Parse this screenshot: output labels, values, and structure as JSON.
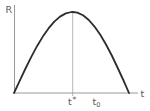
{
  "labels": {
    "y_axis": "R",
    "x_axis": "t",
    "peak_base": "t",
    "peak_sup": "*",
    "t0_base": "t",
    "t0_sub": "0"
  },
  "colors": {
    "curve": "#2d2d2d",
    "axis": "#9a9a9a",
    "guide": "#b7b7b7",
    "label": "#5a5a5a",
    "background": "#ffffff"
  },
  "chart_data": {
    "type": "line",
    "title": "",
    "xlabel": "t",
    "ylabel": "R",
    "xlim": [
      0,
      1
    ],
    "ylim": [
      0,
      1
    ],
    "grid": false,
    "legend": "none",
    "x_tick_labels": [
      "t*",
      "t₀"
    ],
    "x_tick_positions": [
      0.51,
      0.71
    ],
    "annotations": [
      {
        "type": "vline",
        "x": 0.51,
        "label": "t*",
        "note": "light vertical guide from curve peak down to the t-axis"
      }
    ],
    "series": [
      {
        "name": "R(t)",
        "x": [
          0,
          0.05,
          0.1,
          0.15,
          0.2,
          0.25,
          0.3,
          0.35,
          0.4,
          0.45,
          0.5,
          0.51,
          0.55,
          0.6,
          0.65,
          0.7,
          0.75,
          0.8,
          0.85,
          0.9,
          0.95,
          1.0
        ],
        "y": [
          0,
          0.153,
          0.303,
          0.446,
          0.578,
          0.696,
          0.798,
          0.881,
          0.943,
          0.983,
          0.9995,
          1.0,
          0.992,
          0.959,
          0.901,
          0.82,
          0.719,
          0.599,
          0.463,
          0.315,
          0.16,
          0
        ]
      }
    ]
  }
}
